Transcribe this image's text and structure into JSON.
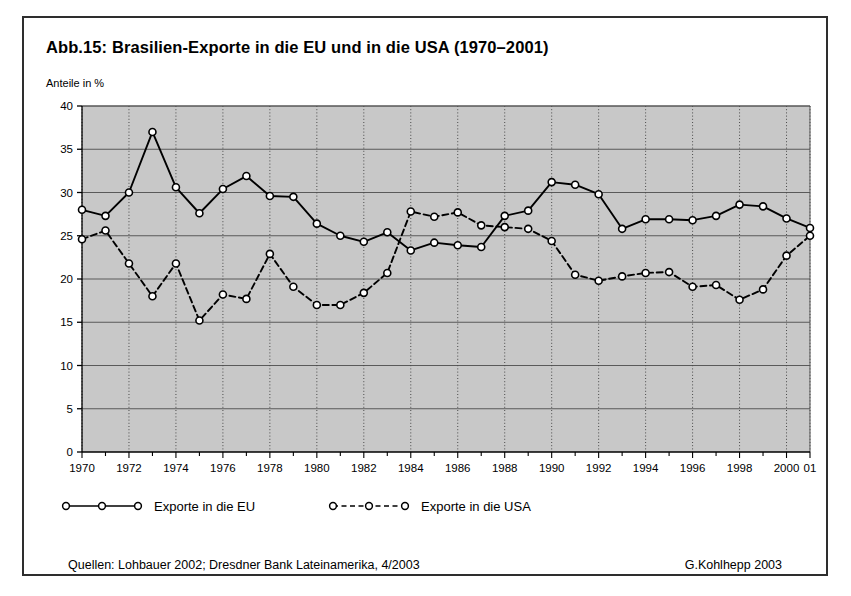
{
  "figure": {
    "title": "Abb.15: Brasilien-Exporte in die EU und in die USA (1970–2001)",
    "y_axis_caption": "Anteile in %"
  },
  "legend": {
    "eu_label": "Exporte in die EU",
    "usa_label": "Exporte in die USA"
  },
  "footer": {
    "source": "Quellen: Lohbauer 2002; Dresdner Bank Lateinamerika, 4/2003",
    "credit": "G.Kohlhepp 2003"
  },
  "colors": {
    "plot_background": "#c8c8c8",
    "frame": "#2e2e2e",
    "gridline": "#5a5a5a",
    "series_line": "#000000",
    "marker_fill": "#ffffff",
    "page_background": "#ffffff"
  },
  "chart_data": {
    "type": "line",
    "title": "Abb.15: Brasilien-Exporte in die EU und in die USA (1970–2001)",
    "xlabel": "",
    "ylabel": "Anteile in %",
    "ylim": [
      0,
      40
    ],
    "ytick_step": 5,
    "yticks": [
      0,
      5,
      10,
      15,
      20,
      25,
      30,
      35,
      40
    ],
    "xlim": [
      1970,
      2001
    ],
    "grid": true,
    "legend_position": "below-plot",
    "x": [
      1970,
      1971,
      1972,
      1973,
      1974,
      1975,
      1976,
      1977,
      1978,
      1979,
      1980,
      1981,
      1982,
      1983,
      1984,
      1985,
      1986,
      1987,
      1988,
      1989,
      1990,
      1991,
      1992,
      1993,
      1994,
      1995,
      1996,
      1997,
      1998,
      1999,
      2000,
      2001
    ],
    "xtick_labels": [
      "1970",
      "",
      "1972",
      "",
      "1974",
      "",
      "1976",
      "",
      "1978",
      "",
      "1980",
      "",
      "1982",
      "",
      "1984",
      "",
      "1986",
      "",
      "1988",
      "",
      "1990",
      "",
      "1992",
      "",
      "1994",
      "",
      "1996",
      "",
      "1998",
      "",
      "2000",
      "01"
    ],
    "series": [
      {
        "name": "Exporte in die EU",
        "style": "solid",
        "marker": "circle",
        "values": [
          28.0,
          27.3,
          30.0,
          37.0,
          30.6,
          27.6,
          30.4,
          31.9,
          29.6,
          29.5,
          26.4,
          25.0,
          24.3,
          25.4,
          23.3,
          24.2,
          23.9,
          23.7,
          27.3,
          27.9,
          31.2,
          30.9,
          29.8,
          25.8,
          26.9,
          26.9,
          26.8,
          27.3,
          28.6,
          28.4,
          27.0,
          25.9
        ]
      },
      {
        "name": "Exporte in die USA",
        "style": "dashed",
        "marker": "circle",
        "values": [
          24.6,
          25.6,
          21.8,
          18.0,
          21.8,
          15.2,
          18.2,
          17.7,
          22.9,
          19.1,
          17.0,
          17.0,
          18.4,
          20.7,
          27.8,
          27.2,
          27.7,
          26.2,
          26.0,
          25.8,
          24.4,
          20.5,
          19.8,
          20.3,
          20.7,
          20.8,
          19.1,
          19.3,
          17.6,
          18.8,
          22.7,
          25.0
        ]
      }
    ]
  }
}
